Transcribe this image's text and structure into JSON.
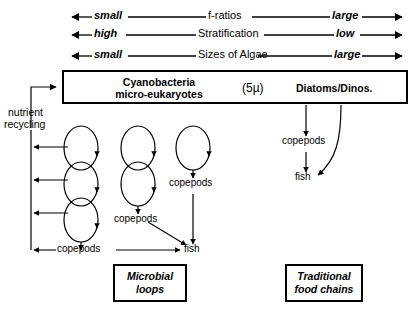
{
  "diagram": {
    "scales": [
      {
        "left": "small",
        "middle": "f-ratios",
        "right": "large"
      },
      {
        "left": "high",
        "middle": "Stratification",
        "right": "low"
      },
      {
        "left": "small",
        "middle": "Sizes of Algae",
        "right": "large"
      }
    ],
    "main_box": {
      "left_label_line1": "Cyanobacteria",
      "left_label_line2": "micro-eukaryotes",
      "size_label": "(5µ)",
      "right_label": "Diatoms/Dinos."
    },
    "nutrient_recycling": {
      "line1": "nutrient",
      "line2": "recycling"
    },
    "nodes": {
      "copepods_chain1": "copepods",
      "copepods_chain2": "copepods",
      "copepods_chain3": "copepods",
      "copepods_right": "copepods",
      "fish_left": "fish",
      "fish_right": "fish"
    },
    "legends": {
      "microbial_line1": "Microbial",
      "microbial_line2": "loops",
      "traditional_line1": "Traditional",
      "traditional_line2": "food chains"
    },
    "colors": {
      "ink": "#000000",
      "paper": "#ffffff"
    }
  }
}
